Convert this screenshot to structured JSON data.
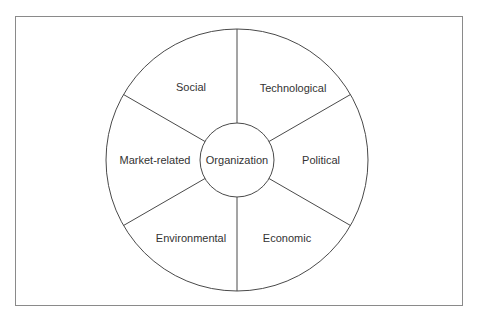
{
  "diagram": {
    "type": "concentric-wheel",
    "center": {
      "label": "Organization"
    },
    "segments": [
      {
        "label": "Social"
      },
      {
        "label": "Technological"
      },
      {
        "label": "Political"
      },
      {
        "label": "Economic"
      },
      {
        "label": "Environmental"
      },
      {
        "label": "Market-related"
      }
    ],
    "colors": {
      "stroke": "#4a4a4a",
      "frame": "#8a8a8a",
      "text": "#333333",
      "background": "#ffffff"
    }
  }
}
